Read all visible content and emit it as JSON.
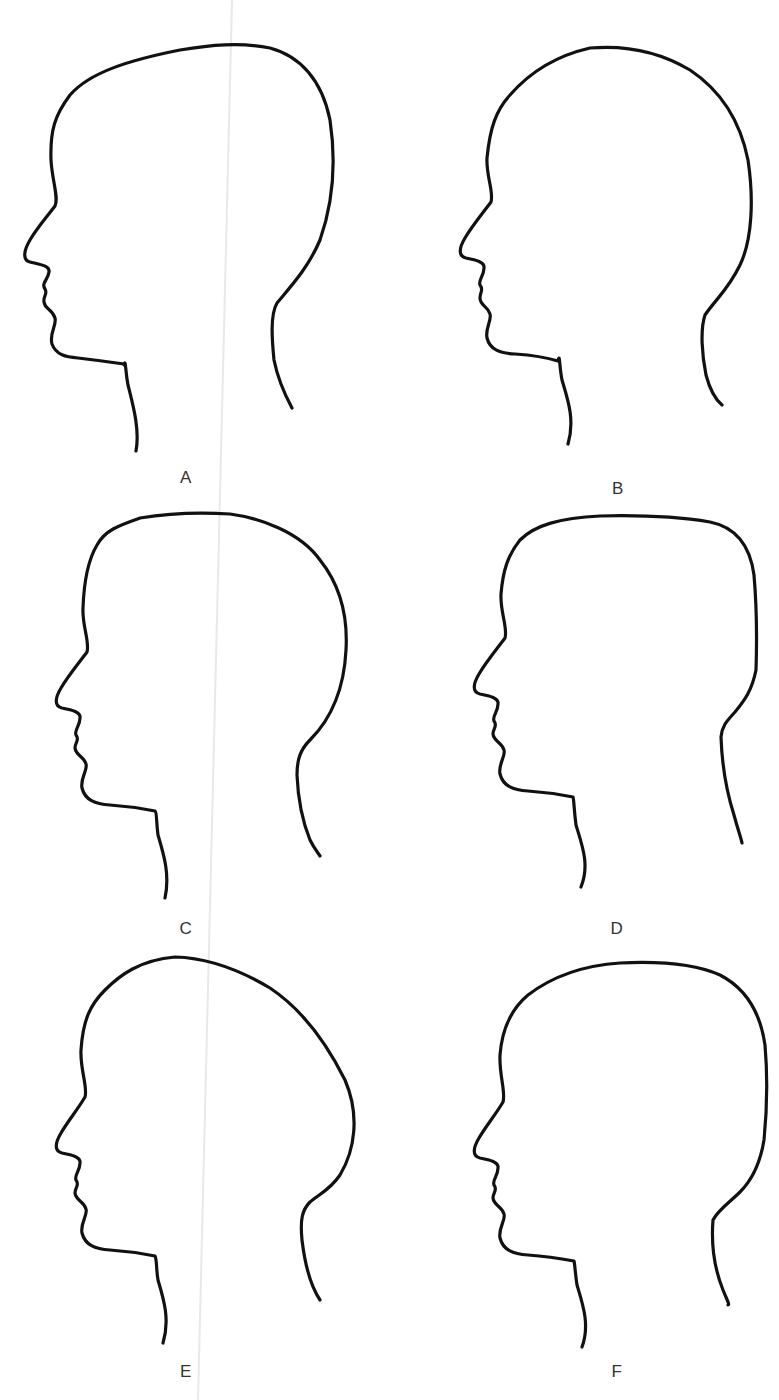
{
  "figure": {
    "layout": "2 columns x 3 rows",
    "stroke_color": "#111111",
    "label_color": "#333333",
    "background": "#ffffff"
  },
  "profiles": [
    {
      "label": "A",
      "shape": "long, sloping cranium elongated toward the back",
      "label_pos": [
        186,
        478
      ],
      "path": "M 136 451 C 140 430, 133 405, 128 385 C 125 370, 126 358, 124 365 L 124 364 C 110 362, 95 360, 78 358 C 66 357, 56 355, 52 344 C 49 333, 57 325, 55 318 C 52 308, 45 310, 44 302 C 43 296, 48 294, 45 289 C 41 283, 48 280, 49 272 C 50 266, 42 265, 30 262 C 22 260, 24 250, 30 240 C 37 228, 46 218, 55 206 C 59 198, 52 180, 51 160 C 50 130, 55 115, 70 95 C 90 72, 130 60, 180 50 C 210 45, 240 42, 270 48 C 300 56, 322 80, 330 120 C 336 160, 334 200, 320 240 C 308 268, 292 285, 277 303 C 270 315, 272 340, 274 360 C 278 380, 285 395, 292 408"
    },
    {
      "label": "B",
      "shape": "rounded, high-domed cranium",
      "label_pos": [
        618,
        489
      ],
      "path": "M 568 444 C 575 420, 568 400, 562 380 C 559 365, 560 352, 558 361 C 545 357, 530 355, 515 354 C 500 353, 490 350, 487 338 C 485 328, 492 320, 490 314 C 488 306, 480 306, 480 298 C 480 292, 484 290, 480 285 C 478 280, 484 276, 484 268 C 485 262, 476 260, 466 258 C 458 256, 459 248, 465 238 C 472 226, 482 214, 491 202 C 494 192, 486 176, 487 158 C 490 128, 496 110, 510 95 C 530 72, 555 56, 590 48 C 625 45, 660 52, 690 70 C 720 90, 740 120, 748 160 C 754 200, 752 240, 740 265 C 728 290, 715 300, 705 315 C 700 330, 702 355, 706 375 C 710 390, 716 400, 722 405"
    },
    {
      "label": "C",
      "shape": "flat-topped cranium with sloping back",
      "label_pos": [
        186,
        929
      ],
      "path": "M 165 898 C 170 875, 164 855, 158 835 C 156 820, 157 812, 155 811 C 140 808, 125 806, 110 805 C 95 804, 85 800, 82 788 C 80 778, 88 770, 86 764 C 84 756, 76 756, 75 748 C 75 742, 80 740, 76 735 C 74 730, 80 726, 80 718 C 81 712, 72 710, 62 708 C 54 706, 55 698, 61 688 C 68 676, 78 664, 87 652 C 90 642, 82 626, 83 608 C 84 580, 88 560, 97 545 C 105 530, 120 525, 140 518 C 170 513, 200 512, 230 514 C 260 518, 300 532, 320 560 C 340 585, 348 615, 346 650 C 344 690, 330 720, 310 740 C 300 750, 297 760, 297 775 C 298 800, 302 820, 310 840 C 314 848, 318 853, 320 856"
    },
    {
      "label": "D",
      "shape": "boxy cranium with flat top and vertical back",
      "label_pos": [
        617,
        929
      ],
      "path": "M 581 887 C 590 865, 582 845, 576 825 C 574 810, 574 800, 573 797 C 558 794, 543 792, 528 791 C 513 790, 503 786, 500 774 C 498 764, 506 756, 504 750 C 502 742, 494 742, 493 734 C 493 728, 498 726, 494 721 C 492 716, 498 712, 498 704 C 499 698, 490 696, 480 694 C 472 692, 473 684, 479 674 C 486 662, 496 650, 505 638 C 508 628, 500 612, 501 594 C 503 570, 508 555, 520 540 C 535 525, 560 518, 600 516 C 640 515, 680 517, 710 522 C 735 527, 750 545, 754 575 C 757 610, 757 640, 756 670 C 752 690, 745 700, 735 712 C 728 720, 722 725, 721 737 C 722 765, 726 790, 734 815 C 738 830, 741 838, 742 843"
    },
    {
      "label": "E",
      "shape": "elongated cranium protruding far to the back",
      "label_pos": [
        186,
        1372
      ],
      "path": "M 163 1343 C 170 1320, 164 1300, 158 1280 C 156 1268, 157 1260, 155 1256 C 140 1253, 125 1251, 110 1250 C 95 1249, 85 1245, 82 1233 C 80 1223, 88 1215, 86 1209 C 84 1201, 76 1201, 75 1193 C 75 1187, 80 1185, 76 1180 C 74 1175, 80 1171, 80 1163 C 81 1157, 72 1155, 62 1153 C 54 1151, 55 1143, 61 1133 C 68 1121, 78 1109, 85 1097 C 88 1087, 80 1070, 81 1050 C 83 1020, 90 1005, 105 990 C 120 975, 140 960, 175 957 C 210 958, 240 970, 270 988 C 300 1008, 325 1040, 345 1080 C 360 1115, 355 1150, 340 1175 C 330 1190, 318 1195, 310 1202 C 302 1210, 300 1220, 302 1240 C 305 1265, 310 1285, 320 1300"
    },
    {
      "label": "F",
      "shape": "rounded-square cranium with fuller back",
      "label_pos": [
        617,
        1372
      ],
      "path": "M 582 1347 C 590 1325, 583 1305, 577 1285 C 575 1272, 575 1265, 574 1261 C 558 1258, 543 1256, 528 1255 C 513 1254, 503 1250, 500 1238 C 498 1228, 506 1220, 504 1214 C 502 1206, 494 1206, 493 1198 C 493 1192, 498 1190, 494 1185 C 492 1180, 498 1176, 498 1168 C 499 1162, 490 1160, 480 1158 C 472 1156, 473 1148, 479 1138 C 486 1126, 496 1114, 503 1102 C 506 1092, 499 1075, 500 1055 C 502 1030, 510 1010, 528 995 C 545 982, 575 966, 620 963 C 660 961, 695 964, 720 975 C 745 988, 760 1010, 765 1045 C 768 1080, 767 1110, 764 1140 C 760 1165, 752 1180, 740 1192 C 730 1202, 718 1210, 713 1220 C 711 1245, 715 1270, 723 1290 C 727 1300, 730 1305, 728 1305"
    }
  ]
}
